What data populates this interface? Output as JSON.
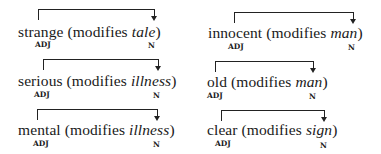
{
  "examples": [
    {
      "adj": "strange",
      "pre": "strange (modifies ",
      "noun": "tale",
      "post": ")",
      "adj_tag": "ADJ",
      "noun_tag": "N"
    },
    {
      "adj": "serious",
      "pre": "serious (modifies ",
      "noun": "illness",
      "post": ")",
      "adj_tag": "ADJ",
      "noun_tag": "N"
    },
    {
      "adj": "mental",
      "pre": "mental (modifies ",
      "noun": "illness",
      "post": ")",
      "adj_tag": "ADJ",
      "noun_tag": "N"
    },
    {
      "adj": "innocent",
      "pre": "innocent (modifies ",
      "noun": "man",
      "post": ")",
      "adj_tag": "ADJ",
      "noun_tag": "N"
    },
    {
      "adj": "old",
      "pre": "old (modifies ",
      "noun": "man",
      "post": ")",
      "adj_tag": "ADJ",
      "noun_tag": "N"
    },
    {
      "adj": "clear",
      "pre": "clear (modifies ",
      "noun": "sign",
      "post": ")",
      "adj_tag": "ADJ",
      "noun_tag": "N"
    }
  ]
}
